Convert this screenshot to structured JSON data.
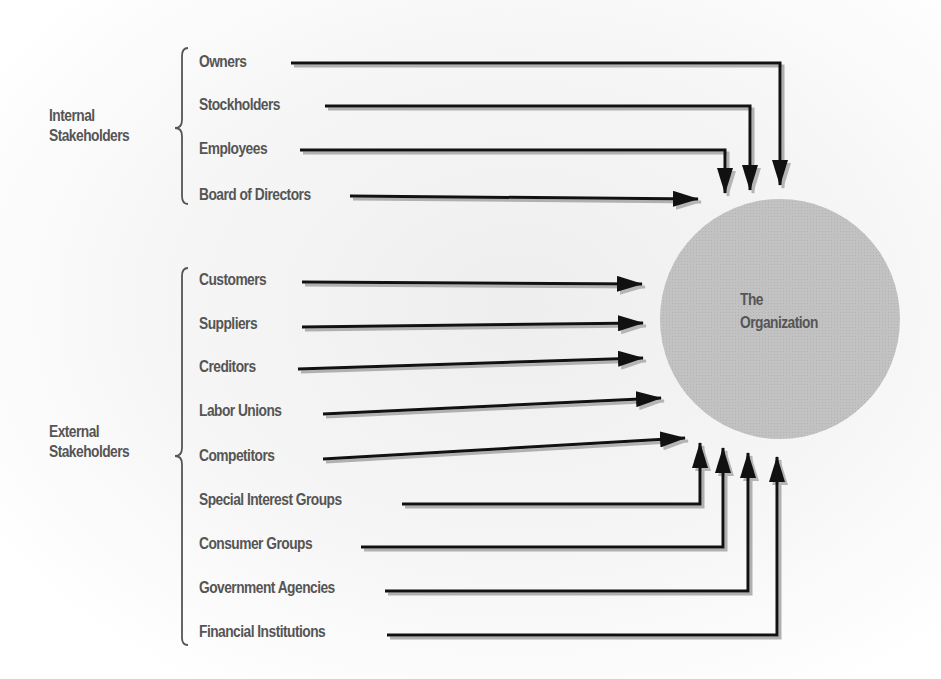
{
  "organization": {
    "line1": "The",
    "line2": "Organization",
    "center": [
      780,
      319
    ],
    "radius": 120,
    "fill": "#bdbdbd"
  },
  "groups": {
    "internal": {
      "line1": "Internal",
      "line2": "Stakeholders"
    },
    "external": {
      "line1": "External",
      "line2": "Stakeholders"
    }
  },
  "stakeholders": [
    {
      "label": "Owners",
      "group": "internal",
      "text_y": 63,
      "line": [
        [
          291,
          63
        ],
        [
          780,
          63
        ],
        [
          780,
          185
        ]
      ]
    },
    {
      "label": "Stockholders",
      "group": "internal",
      "text_y": 106,
      "line": [
        [
          325,
          106
        ],
        [
          750,
          106
        ],
        [
          750,
          190
        ]
      ]
    },
    {
      "label": "Employees",
      "group": "internal",
      "text_y": 150,
      "line": [
        [
          300,
          150
        ],
        [
          725,
          150
        ],
        [
          725,
          193
        ]
      ]
    },
    {
      "label": "Board of Directors",
      "group": "internal",
      "text_y": 196,
      "line": [
        [
          350,
          196
        ],
        [
          698,
          199
        ]
      ]
    },
    {
      "label": "Customers",
      "group": "external",
      "text_y": 281,
      "line": [
        [
          302,
          282
        ],
        [
          642,
          284
        ]
      ]
    },
    {
      "label": "Suppliers",
      "group": "external",
      "text_y": 325,
      "line": [
        [
          302,
          327
        ],
        [
          643,
          323
        ]
      ]
    },
    {
      "label": "Creditors",
      "group": "external",
      "text_y": 368,
      "line": [
        [
          298,
          369
        ],
        [
          643,
          358
        ]
      ]
    },
    {
      "label": "Labor Unions",
      "group": "external",
      "text_y": 412,
      "line": [
        [
          323,
          414
        ],
        [
          661,
          398
        ]
      ]
    },
    {
      "label": "Competitors",
      "group": "external",
      "text_y": 457,
      "line": [
        [
          323,
          459
        ],
        [
          685,
          438
        ]
      ]
    },
    {
      "label": "Special Interest Groups",
      "group": "external",
      "text_y": 501,
      "line": [
        [
          402,
          504
        ],
        [
          700,
          504
        ],
        [
          700,
          443
        ]
      ]
    },
    {
      "label": "Consumer Groups",
      "group": "external",
      "text_y": 545,
      "line": [
        [
          361,
          547
        ],
        [
          723,
          547
        ],
        [
          723,
          448
        ]
      ]
    },
    {
      "label": "Government Agencies",
      "group": "external",
      "text_y": 589,
      "line": [
        [
          385,
          591
        ],
        [
          748,
          591
        ],
        [
          748,
          453
        ]
      ]
    },
    {
      "label": "Financial Institutions",
      "group": "external",
      "text_y": 633,
      "line": [
        [
          387,
          635
        ],
        [
          777,
          635
        ],
        [
          777,
          457
        ]
      ]
    }
  ],
  "colors": {
    "text": "#555555",
    "arrow": "#111111",
    "shadow": "#b0b0b0",
    "brace": "#555555"
  }
}
